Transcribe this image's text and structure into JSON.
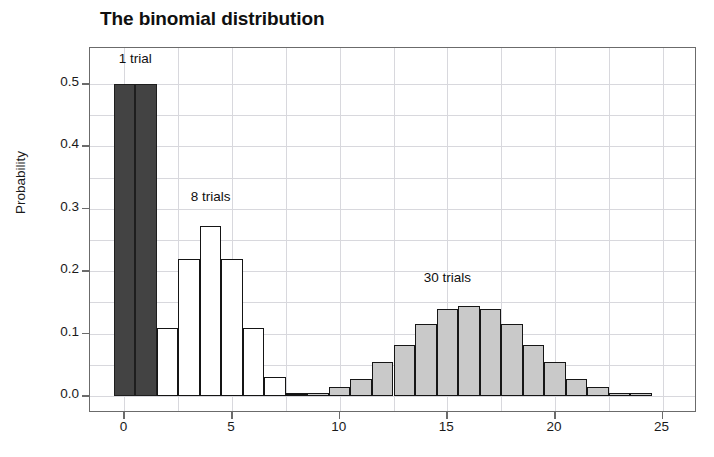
{
  "chart_data": {
    "type": "bar",
    "title": "The binomial distribution",
    "xlabel": "",
    "ylabel": "Probability",
    "xlim": [
      -1.6,
      26.6
    ],
    "ylim": [
      0.0,
      0.545
    ],
    "grid": true,
    "legend_position": "inline-annotations",
    "x_ticks": [
      0,
      5,
      10,
      15,
      20,
      25
    ],
    "x_tick_labels": [
      "0",
      "5",
      "10",
      "15",
      "20",
      "25"
    ],
    "x_minor_gridline_step": 2.5,
    "y_ticks": [
      0.0,
      0.1,
      0.2,
      0.3,
      0.4,
      0.5
    ],
    "y_tick_labels": [
      "0.0",
      "0.1",
      "0.2",
      "0.3",
      "0.4",
      "0.5"
    ],
    "y_minor_gridline_step": 0.05,
    "annotations": [
      {
        "text": "1 trial",
        "x": 0.5,
        "y": 0.525
      },
      {
        "text": "8 trials",
        "x": 4.0,
        "y": 0.305
      },
      {
        "text": "30 trials",
        "x": 15.0,
        "y": 0.175
      }
    ],
    "series": [
      {
        "name": "1 trial",
        "color": "#434343",
        "edge_color": "#1e1e1e",
        "x": [
          0,
          1
        ],
        "values": [
          0.5,
          0.5
        ]
      },
      {
        "name": "8 trials",
        "color": "#ffffff",
        "edge_color": "#151515",
        "x": [
          0,
          1,
          2,
          3,
          4,
          5,
          6,
          7,
          8
        ],
        "values": [
          0.004,
          0.031,
          0.109,
          0.219,
          0.273,
          0.219,
          0.109,
          0.031,
          0.004
        ]
      },
      {
        "name": "30 trials",
        "color": "#c9c9c9",
        "edge_color": "#161616",
        "x": [
          8,
          9,
          10,
          11,
          12,
          13,
          14,
          15,
          16,
          17,
          18,
          19,
          20,
          21,
          22,
          23,
          24
        ],
        "values": [
          0.005,
          0.005,
          0.014,
          0.028,
          0.055,
          0.081,
          0.115,
          0.14,
          0.145,
          0.14,
          0.115,
          0.081,
          0.055,
          0.028,
          0.014,
          0.005,
          0.005
        ]
      }
    ]
  }
}
